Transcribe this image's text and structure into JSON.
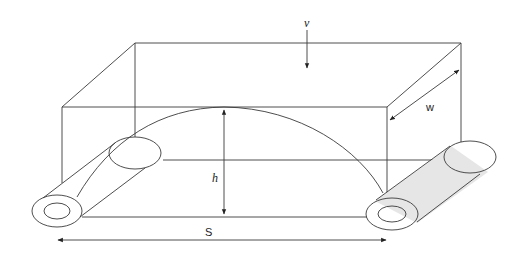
{
  "diagram": {
    "title": "",
    "colors": {
      "line": "#3a3a3a",
      "shade": "#e6e6e6",
      "background": "#ffffff"
    },
    "labels": {
      "v": "v",
      "h": "h",
      "w": "w",
      "S": "S"
    },
    "elements": [
      {
        "id": "box",
        "type": "rectangular-prism-outline"
      },
      {
        "id": "arch",
        "type": "parabolic-arch",
        "label": "h"
      },
      {
        "id": "tube-left",
        "type": "hollow-cylinder",
        "shaded": false
      },
      {
        "id": "tube-right",
        "type": "hollow-cylinder",
        "shaded": true
      },
      {
        "id": "load-arrow",
        "type": "arrow-down",
        "label": "v"
      },
      {
        "id": "height-dim",
        "type": "double-arrow-vertical",
        "label": "h"
      },
      {
        "id": "span-dim",
        "type": "double-arrow-horizontal",
        "label": "S"
      },
      {
        "id": "width-dim",
        "type": "double-arrow-diagonal",
        "label": "w"
      }
    ]
  }
}
